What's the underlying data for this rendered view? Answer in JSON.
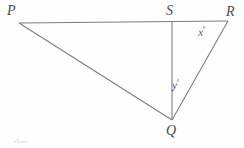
{
  "figure": {
    "name": "triangle-pqr-with-cevian-qs",
    "background_color": "#fefefe",
    "stroke_color": "#7d7d7d",
    "label_color": "#4a4a4a",
    "vertices": [
      {
        "id": "P",
        "label": "P",
        "x": 19,
        "y": 23
      },
      {
        "id": "S",
        "label": "S",
        "x": 172,
        "y": 22
      },
      {
        "id": "R",
        "label": "R",
        "x": 228,
        "y": 21
      },
      {
        "id": "Q",
        "label": "Q",
        "x": 172,
        "y": 120
      }
    ],
    "segments": [
      {
        "id": "PR",
        "from": "P",
        "to": "R"
      },
      {
        "id": "PQ",
        "from": "P",
        "to": "Q"
      },
      {
        "id": "SQ",
        "from": "S",
        "to": "Q"
      },
      {
        "id": "QR",
        "from": "Q",
        "to": "R"
      }
    ],
    "angle_labels": [
      {
        "id": "angle-x",
        "variable": "x",
        "degree_symbol": "°",
        "at_vertex": "R",
        "x": 198,
        "y": 26
      },
      {
        "id": "angle-y",
        "variable": "y",
        "degree_symbol": "°",
        "at_vertex": "Q",
        "x": 172,
        "y": 79
      }
    ],
    "artifact_text": "thm"
  }
}
